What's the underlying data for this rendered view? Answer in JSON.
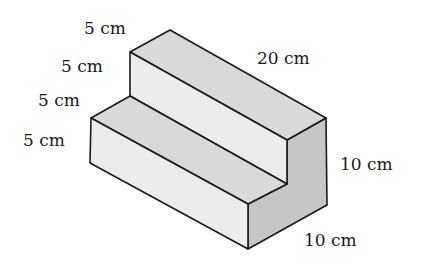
{
  "figure": {
    "type": "isometric-step-solid",
    "colors": {
      "top_face": "#d9d9d9",
      "front_face": "#ececec",
      "side_face": "#c6c6c6",
      "edge": "#1a1a1a",
      "background": "#ffffff"
    }
  },
  "labels": {
    "upper_step_depth": "5 cm",
    "upper_step_height": "5 cm",
    "lower_step_depth": "5 cm",
    "lower_step_height": "5 cm",
    "length": "20 cm",
    "total_height": "10 cm",
    "total_width": "10 cm"
  }
}
